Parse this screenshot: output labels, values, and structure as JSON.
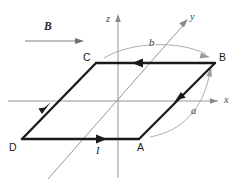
{
  "figure": {
    "background_color": "#ffffff"
  },
  "axes": {
    "z_label": "z",
    "y_label": "y",
    "x_label": "x",
    "color": "#8a8a8a",
    "origin": {
      "x": 118,
      "y": 101
    }
  },
  "field": {
    "label": "B",
    "direction": "+x",
    "color": "#6f6f6f"
  },
  "loop": {
    "color": "#1a1a1a",
    "current_label": "I",
    "current_sense": "D -> A -> B -> C -> D",
    "vertices": [
      {
        "name": "C",
        "label": "C",
        "x": 96,
        "y": 63
      },
      {
        "name": "B",
        "label": "B",
        "x": 215,
        "y": 63
      },
      {
        "name": "A",
        "label": "A",
        "x": 139,
        "y": 139
      },
      {
        "name": "D",
        "label": "D",
        "x": 22,
        "y": 139
      }
    ]
  },
  "dimensions": {
    "side_a_label": "a",
    "side_b_label": "b",
    "color": "#9a9a9a"
  }
}
